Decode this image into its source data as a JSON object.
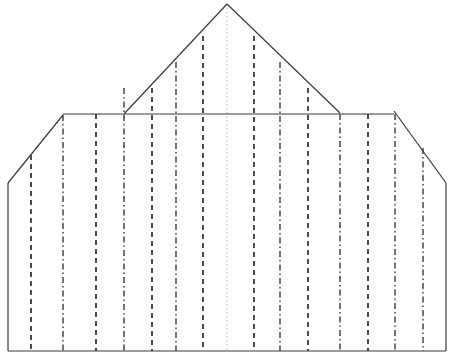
{
  "canvas": {
    "width": 455,
    "height": 361,
    "background": "#ffffff",
    "title": "sectioned-gable-elevation-drawing"
  },
  "style": {
    "outline_color": "#3a3a3a",
    "outline_width": 1.2,
    "dashed_color": "#1f1f1f",
    "dashed_width": 1.6,
    "dashed_pattern": "5,4",
    "dashdot_color": "#2a2a2a",
    "dashdot_width": 1.3,
    "dashdot_pattern": "6,3,1.5,3",
    "centerline_color": "#b8b8b8",
    "centerline_width": 1.0,
    "centerline_pattern": "1.5,2.5"
  },
  "geometry": {
    "apex": {
      "x": 227,
      "y": 4
    },
    "eave_left": {
      "x": 124,
      "y": 114
    },
    "eave_right": {
      "x": 340,
      "y": 113
    },
    "shoulder_left": {
      "x": 63,
      "y": 115
    },
    "shoulder_right": {
      "x": 394,
      "y": 111
    },
    "chamfer_left_bottom": {
      "x": 8,
      "y": 183
    },
    "chamfer_right_bottom": {
      "x": 446,
      "y": 183
    },
    "base_left": {
      "x": 8,
      "y": 351
    },
    "base_right": {
      "x": 446,
      "y": 351
    },
    "eaves_line_y": 114,
    "baseline_y": 351
  },
  "outline_segments": [
    {
      "name": "baseline",
      "x1": 8,
      "y1": 351,
      "x2": 446,
      "y2": 351
    },
    {
      "name": "left-wall",
      "x1": 8,
      "y1": 183,
      "x2": 8,
      "y2": 351
    },
    {
      "name": "left-chamfer",
      "x1": 8,
      "y1": 183,
      "x2": 63,
      "y2": 115
    },
    {
      "name": "eaves-line",
      "x1": 63,
      "y1": 114,
      "x2": 394,
      "y2": 114
    },
    {
      "name": "right-chamfer",
      "x1": 394,
      "y1": 111,
      "x2": 446,
      "y2": 183
    },
    {
      "name": "right-wall",
      "x1": 446,
      "y1": 183,
      "x2": 446,
      "y2": 351
    },
    {
      "name": "roof-left-slope",
      "x1": 124,
      "y1": 114,
      "x2": 227,
      "y2": 4
    },
    {
      "name": "roof-right-slope",
      "x1": 227,
      "y1": 4,
      "x2": 340,
      "y2": 113
    }
  ],
  "centerline": {
    "name": "vertical-centerline",
    "x": 227,
    "y_top": 4,
    "y_bottom": 351,
    "style": "dotted"
  },
  "section_lines": [
    {
      "id": 1,
      "x": 31,
      "y_top": 155,
      "y_bottom": 351,
      "style": "dashed"
    },
    {
      "id": 2,
      "x": 63,
      "y_top": 115,
      "y_bottom": 351,
      "style": "dashdot"
    },
    {
      "id": 3,
      "x": 96,
      "y_top": 114,
      "y_bottom": 351,
      "style": "dashed"
    },
    {
      "id": 4,
      "x": 124,
      "y_top": 88,
      "y_bottom": 351,
      "style": "dashdot"
    },
    {
      "id": 5,
      "x": 152,
      "y_top": 88,
      "y_bottom": 351,
      "style": "dashed"
    },
    {
      "id": 6,
      "x": 176,
      "y_top": 62,
      "y_bottom": 351,
      "style": "dashdot"
    },
    {
      "id": 7,
      "x": 203,
      "y_top": 36,
      "y_bottom": 351,
      "style": "dashed"
    },
    {
      "id": 8,
      "x": 254,
      "y_top": 36,
      "y_bottom": 351,
      "style": "dashed"
    },
    {
      "id": 9,
      "x": 280,
      "y_top": 62,
      "y_bottom": 351,
      "style": "dashdot"
    },
    {
      "id": 10,
      "x": 308,
      "y_top": 88,
      "y_bottom": 351,
      "style": "dashed"
    },
    {
      "id": 11,
      "x": 340,
      "y_top": 114,
      "y_bottom": 351,
      "style": "dashdot"
    },
    {
      "id": 12,
      "x": 368,
      "y_top": 114,
      "y_bottom": 351,
      "style": "dashed"
    },
    {
      "id": 13,
      "x": 395,
      "y_top": 114,
      "y_bottom": 351,
      "style": "dashdot"
    },
    {
      "id": 14,
      "x": 423,
      "y_top": 148,
      "y_bottom": 351,
      "style": "dashdot"
    }
  ]
}
